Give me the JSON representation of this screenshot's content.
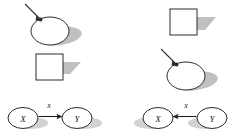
{
  "figure": {
    "title": "",
    "width": 236,
    "height": 138,
    "background": "#ffffff",
    "panels": [
      {
        "id": "left-panel",
        "name": "left-panel",
        "items": [
          {
            "kind": "ellipse-with-pointer",
            "name": "ellipse-shape-selected",
            "label": "",
            "outline_color": "#2b2b2b",
            "fill_color": "#ffffff",
            "shadow_color": "#9a9a9a",
            "pointer": "arrow-pointer-icon"
          },
          {
            "kind": "square",
            "name": "square-shape",
            "label": "",
            "outline_color": "#2b2b2b",
            "fill_color": "#ffffff",
            "shadow_color": "#9a9a9a"
          }
        ],
        "graph": {
          "name": "causal-graph-x-to-y",
          "direction": "forward",
          "nodes": [
            {
              "id": "x",
              "label": "X"
            },
            {
              "id": "y",
              "label": "Y"
            }
          ],
          "edge": {
            "from": "x",
            "to": "y",
            "label": "x"
          }
        }
      },
      {
        "id": "right-panel",
        "name": "right-panel",
        "items": [
          {
            "kind": "square",
            "name": "square-shape",
            "label": "",
            "outline_color": "#2b2b2b",
            "fill_color": "#ffffff",
            "shadow_color": "#9a9a9a"
          },
          {
            "kind": "ellipse-with-pointer",
            "name": "ellipse-shape-selected",
            "label": "",
            "outline_color": "#2b2b2b",
            "fill_color": "#ffffff",
            "shadow_color": "#9a9a9a",
            "pointer": "arrow-pointer-icon"
          }
        ],
        "graph": {
          "name": "causal-graph-y-to-x",
          "direction": "reverse",
          "nodes": [
            {
              "id": "x",
              "label": "X"
            },
            {
              "id": "y",
              "label": "Y"
            }
          ],
          "edge": {
            "from": "y",
            "to": "x",
            "label": "x"
          }
        }
      }
    ],
    "colors": {
      "outline": "#2b2b2b",
      "shadow": "#9a9a9a",
      "text": "#1a1a1a",
      "arrow": "#222222"
    }
  }
}
